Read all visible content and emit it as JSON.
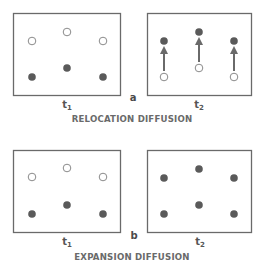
{
  "colors": {
    "frame": "#6a6a6a",
    "filled_dot": "#5a5a5a",
    "open_dot_stroke": "#8a8a8a",
    "arrow": "#6a6a6a",
    "caption": "#6a6a6a"
  },
  "panels": [
    {
      "letter": "a",
      "caption": "RELOCATION DIFFUSION",
      "frames": [
        {
          "time_label": "t",
          "time_sub": "1",
          "role": "before"
        },
        {
          "time_label": "t",
          "time_sub": "2",
          "role": "after"
        }
      ]
    },
    {
      "letter": "b",
      "caption": "EXPANSION DIFFUSION",
      "frames": [
        {
          "time_label": "t",
          "time_sub": "1",
          "role": "before"
        },
        {
          "time_label": "t",
          "time_sub": "2",
          "role": "after"
        }
      ]
    }
  ],
  "legend_semantics": {
    "filled_dot": "occupied / adopter",
    "open_dot": "unoccupied / non-adopter",
    "arrow": "movement (relocation)"
  }
}
